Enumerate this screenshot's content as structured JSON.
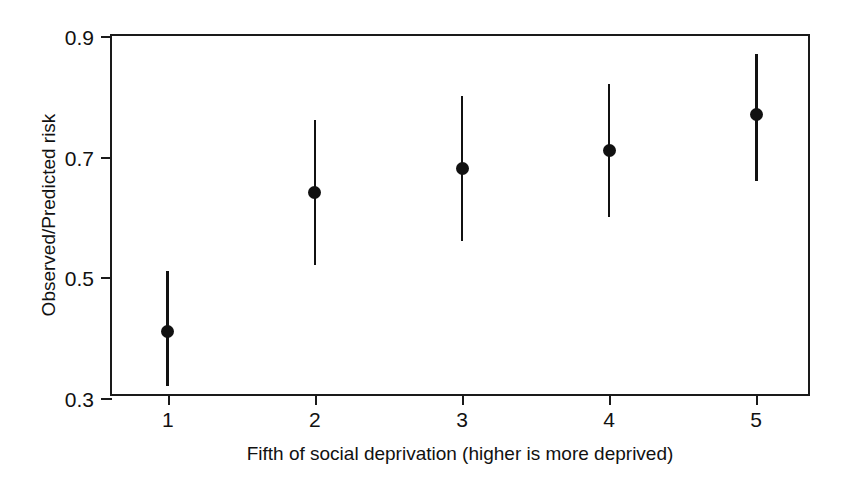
{
  "chart_data": {
    "type": "scatter",
    "title": "",
    "xlabel": "Fifth of social deprivation (higher is more deprived)",
    "ylabel": "Observed/Predicted risk",
    "xlim": [
      0.62,
      5.38
    ],
    "ylim": [
      0.3,
      0.9
    ],
    "grid": false,
    "legend": null,
    "x_tick_labels": [
      "1",
      "2",
      "3",
      "4",
      "5"
    ],
    "x_tick_values": [
      1,
      2,
      3,
      4,
      5
    ],
    "y_tick_labels": [
      "0.9",
      "0.7",
      "0.5",
      "0.3"
    ],
    "y_tick_values": [
      0.9,
      0.7,
      0.5,
      0.3
    ],
    "categories": [
      "1",
      "2",
      "3",
      "4",
      "5"
    ],
    "values": [
      0.41,
      0.64,
      0.68,
      0.71,
      0.77
    ],
    "error_low": [
      0.32,
      0.52,
      0.56,
      0.6,
      0.66
    ],
    "error_high": [
      0.51,
      0.76,
      0.8,
      0.82,
      0.87
    ],
    "marker": "filled-circle",
    "marker_color": "#111111",
    "errorbar_color": "#111111",
    "points": [
      {
        "x": 1,
        "y": 0.41,
        "low": 0.32,
        "high": 0.51,
        "label": "1"
      },
      {
        "x": 2,
        "y": 0.64,
        "low": 0.52,
        "high": 0.76,
        "label": "2"
      },
      {
        "x": 3,
        "y": 0.68,
        "low": 0.56,
        "high": 0.8,
        "label": "3"
      },
      {
        "x": 4,
        "y": 0.71,
        "low": 0.6,
        "high": 0.82,
        "label": "4"
      },
      {
        "x": 5,
        "y": 0.77,
        "low": 0.66,
        "high": 0.87,
        "label": "5"
      }
    ]
  },
  "axes": {
    "x_title": "Fifth of social deprivation (higher is more deprived)",
    "y_title": "Observed/Predicted risk"
  }
}
